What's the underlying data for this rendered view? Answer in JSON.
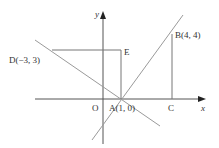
{
  "diagram": {
    "type": "coordinate-geometry",
    "colors": {
      "axis": "#333333",
      "line": "#999999",
      "text": "#333333",
      "background": "#ffffff"
    },
    "axes": {
      "x_label": "x",
      "y_label": "y",
      "origin_label": "O"
    },
    "points": {
      "A": {
        "label": "A(1, 0)"
      },
      "B": {
        "label": "B(4, 4)"
      },
      "C": {
        "label": "C"
      },
      "D": {
        "label": "D(−3, 3)"
      },
      "E": {
        "label": "E"
      }
    }
  }
}
